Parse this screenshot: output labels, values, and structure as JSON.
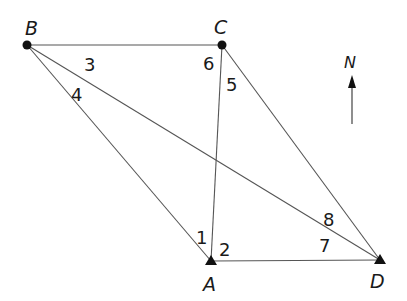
{
  "diagram": {
    "type": "survey-traverse-quadrilateral",
    "colors": {
      "line": "#555555",
      "marker": "#111111",
      "text": "#1a1a1a",
      "background": "#ffffff"
    },
    "points": {
      "A": {
        "label": "A",
        "marker": "triangle",
        "x": 211,
        "y": 261
      },
      "B": {
        "label": "B",
        "marker": "circle",
        "x": 27,
        "y": 45
      },
      "C": {
        "label": "C",
        "marker": "circle",
        "x": 222,
        "y": 45
      },
      "D": {
        "label": "D",
        "marker": "triangle",
        "x": 380,
        "y": 260
      }
    },
    "lines": [
      {
        "from": "B",
        "to": "C"
      },
      {
        "from": "B",
        "to": "A"
      },
      {
        "from": "B",
        "to": "D"
      },
      {
        "from": "C",
        "to": "A"
      },
      {
        "from": "C",
        "to": "D"
      },
      {
        "from": "A",
        "to": "D"
      }
    ],
    "angle_labels": {
      "a1": "1",
      "a2": "2",
      "a3": "3",
      "a4": "4",
      "a5": "5",
      "a6": "6",
      "a7": "7",
      "a8": "8"
    },
    "north_arrow": {
      "label": "N"
    }
  }
}
